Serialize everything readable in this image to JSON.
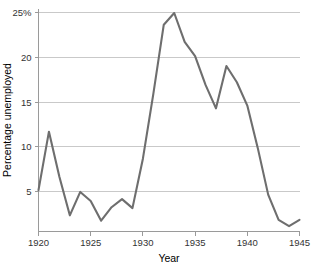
{
  "chart_data": {
    "type": "line",
    "title": "",
    "xlabel": "Year",
    "ylabel": "Percentage unemployed",
    "xlim": [
      1920,
      1945
    ],
    "ylim": [
      0.6,
      25.4
    ],
    "grid": true,
    "legend_position": "none",
    "line_color": "#6e6e6e",
    "x": [
      1920,
      1921,
      1922,
      1923,
      1924,
      1925,
      1926,
      1927,
      1928,
      1929,
      1930,
      1931,
      1932,
      1933,
      1934,
      1935,
      1936,
      1937,
      1938,
      1939,
      1940,
      1941,
      1942,
      1943,
      1944,
      1945
    ],
    "series": [
      {
        "name": "Percentage unemployed",
        "values": [
          5.2,
          11.7,
          6.7,
          2.4,
          5.0,
          4.0,
          1.8,
          3.3,
          4.2,
          3.2,
          8.7,
          15.9,
          23.6,
          24.9,
          21.7,
          20.1,
          16.9,
          14.3,
          19.0,
          17.2,
          14.6,
          9.9,
          4.7,
          1.9,
          1.2,
          1.9
        ]
      }
    ],
    "ytick_values": [
      5,
      10,
      15,
      20,
      25
    ],
    "ytick_labels": [
      "5",
      "10",
      "15",
      "20",
      "25%"
    ],
    "xtick_values": [
      1920,
      1925,
      1930,
      1935,
      1940,
      1945
    ],
    "xtick_labels": [
      "1920",
      "1925",
      "1930",
      "1935",
      "1940",
      "1945"
    ]
  }
}
